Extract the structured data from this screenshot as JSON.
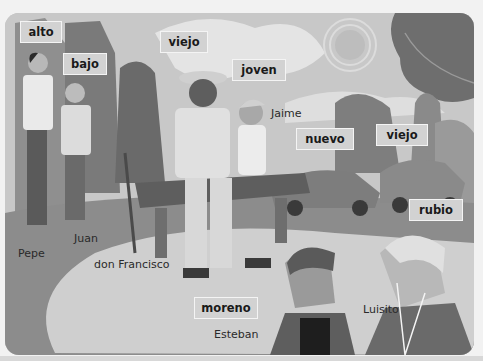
{
  "illustration": {
    "description": "Grayscale park scene with people, bench and cars",
    "labels": [
      {
        "id": "alto",
        "text": "alto"
      },
      {
        "id": "bajo",
        "text": "bajo"
      },
      {
        "id": "viejo-person",
        "text": "viejo"
      },
      {
        "id": "joven",
        "text": "joven"
      },
      {
        "id": "nuevo",
        "text": "nuevo"
      },
      {
        "id": "viejo-car",
        "text": "viejo"
      },
      {
        "id": "rubio",
        "text": "rubio"
      },
      {
        "id": "moreno",
        "text": "moreno"
      }
    ],
    "names": [
      {
        "id": "pepe",
        "text": "Pepe"
      },
      {
        "id": "juan",
        "text": "Juan"
      },
      {
        "id": "don-francisco",
        "text": "don Francisco"
      },
      {
        "id": "jaime",
        "text": "Jaime"
      },
      {
        "id": "esteban",
        "text": "Esteban"
      },
      {
        "id": "luisito",
        "text": "Luisito"
      }
    ]
  },
  "colors": {
    "label_bg": "#d2d2d2",
    "label_border": "#f4f4f4",
    "text": "#1a1a1a"
  }
}
